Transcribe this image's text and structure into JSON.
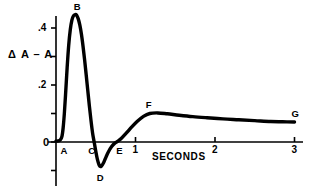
{
  "chart_data": {
    "type": "line",
    "title": "",
    "xlabel": "SECONDS",
    "ylabel": "Δ A – A",
    "xlim": [
      -0.08,
      3.12
    ],
    "ylim": [
      -0.18,
      0.5
    ],
    "grid": false,
    "legend": null,
    "x_ticks": [
      {
        "value": 0,
        "label": "0"
      },
      {
        "value": 1,
        "label": "1"
      },
      {
        "value": 2,
        "label": "2"
      },
      {
        "value": 3,
        "label": "3"
      }
    ],
    "y_ticks": [
      {
        "value": 0.4,
        "label": ".4"
      },
      {
        "value": 0.3,
        "label": ""
      },
      {
        "value": 0.2,
        "label": ".2"
      },
      {
        "value": 0.1,
        "label": ""
      },
      {
        "value": 0.0,
        "label": "0"
      },
      {
        "value": -0.1,
        "label": ""
      }
    ],
    "annotations": [
      {
        "label": "A",
        "x": 0.07,
        "y": 0.0,
        "placement": "below-right"
      },
      {
        "label": "B",
        "x": 0.26,
        "y": 0.445,
        "placement": "above"
      },
      {
        "label": "C",
        "x": 0.48,
        "y": 0.0,
        "placement": "below"
      },
      {
        "label": "D",
        "x": 0.55,
        "y": -0.085,
        "placement": "below"
      },
      {
        "label": "E",
        "x": 0.77,
        "y": 0.0,
        "placement": "below"
      },
      {
        "label": "F",
        "x": 1.18,
        "y": 0.102,
        "placement": "above"
      },
      {
        "label": "G",
        "x": 3.0,
        "y": 0.07,
        "placement": "above"
      }
    ],
    "series": [
      {
        "name": "Δ A – A trace",
        "color": "#000000",
        "x": [
          0.0,
          0.03,
          0.055,
          0.075,
          0.09,
          0.105,
          0.12,
          0.14,
          0.16,
          0.18,
          0.2,
          0.22,
          0.24,
          0.26,
          0.28,
          0.3,
          0.32,
          0.34,
          0.36,
          0.38,
          0.4,
          0.42,
          0.44,
          0.46,
          0.48,
          0.5,
          0.52,
          0.545,
          0.57,
          0.6,
          0.63,
          0.66,
          0.7,
          0.74,
          0.78,
          0.82,
          0.88,
          0.95,
          1.02,
          1.1,
          1.18,
          1.28,
          1.4,
          1.55,
          1.72,
          1.9,
          2.1,
          2.3,
          2.5,
          2.7,
          2.85,
          3.0
        ],
        "y": [
          0.003,
          0.004,
          0.008,
          0.02,
          0.05,
          0.1,
          0.165,
          0.26,
          0.34,
          0.395,
          0.428,
          0.443,
          0.447,
          0.445,
          0.432,
          0.41,
          0.378,
          0.336,
          0.288,
          0.235,
          0.18,
          0.126,
          0.076,
          0.032,
          0.0,
          -0.032,
          -0.06,
          -0.082,
          -0.085,
          -0.072,
          -0.052,
          -0.034,
          -0.016,
          -0.004,
          0.003,
          0.012,
          0.03,
          0.052,
          0.072,
          0.09,
          0.1,
          0.102,
          0.099,
          0.094,
          0.089,
          0.085,
          0.081,
          0.078,
          0.075,
          0.072,
          0.071,
          0.07
        ]
      }
    ]
  },
  "geometry": {
    "origin_x_px": 56,
    "origin_y_px": 142,
    "px_per_second": 79.5,
    "px_per_unit": 285
  }
}
